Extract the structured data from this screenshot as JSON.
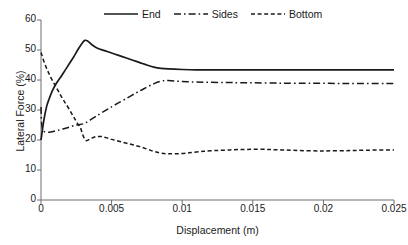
{
  "chart_data": {
    "type": "line",
    "title": "",
    "xlabel": "Displacement (m)",
    "ylabel": "Lateral Force (%)",
    "xlim": [
      0,
      0.025
    ],
    "ylim": [
      0,
      60
    ],
    "xticks": [
      "0",
      "0.005",
      "0.01",
      "0.015",
      "0.02",
      "0.025"
    ],
    "xtick_values": [
      0,
      0.005,
      0.01,
      0.015,
      0.02,
      0.025
    ],
    "yticks": [
      "0",
      "10",
      "20",
      "30",
      "40",
      "50",
      "60"
    ],
    "ytick_values": [
      0,
      10,
      20,
      30,
      40,
      50,
      60
    ],
    "grid": false,
    "legend_position": "top-center",
    "line_color": "#1a1a1a",
    "series": [
      {
        "name": "End",
        "style": "solid",
        "x": [
          0.0,
          0.0002,
          0.0004,
          0.0006,
          0.0008,
          0.0011,
          0.0014,
          0.0017,
          0.002,
          0.0023,
          0.0026,
          0.0029,
          0.0031,
          0.0033,
          0.0036,
          0.004,
          0.0045,
          0.005,
          0.0055,
          0.006,
          0.0065,
          0.007,
          0.0075,
          0.008,
          0.0085,
          0.009,
          0.01,
          0.011,
          0.0125,
          0.014,
          0.016,
          0.018,
          0.02,
          0.0225,
          0.025
        ],
        "values": [
          20.0,
          26.5,
          31.2,
          34.0,
          36.4,
          39.0,
          41.0,
          43.2,
          45.4,
          47.6,
          50.0,
          52.2,
          53.2,
          53.0,
          51.8,
          50.6,
          49.8,
          49.0,
          48.2,
          47.4,
          46.6,
          45.8,
          45.0,
          44.3,
          43.9,
          43.7,
          43.5,
          43.4,
          43.4,
          43.4,
          43.4,
          43.4,
          43.4,
          43.4,
          43.4
        ]
      },
      {
        "name": "Sides",
        "style": "dashdot",
        "x": [
          0.0,
          0.0001,
          0.0005,
          0.001,
          0.0014,
          0.0018,
          0.0022,
          0.0026,
          0.003,
          0.0034,
          0.0038,
          0.0042,
          0.0047,
          0.0052,
          0.0058,
          0.0064,
          0.007,
          0.0075,
          0.008,
          0.0085,
          0.009,
          0.01,
          0.011,
          0.0125,
          0.014,
          0.016,
          0.018,
          0.02,
          0.0225,
          0.025
        ],
        "values": [
          31.0,
          23.8,
          22.6,
          23.0,
          23.5,
          24.0,
          24.6,
          25.1,
          25.4,
          26.4,
          27.6,
          28.8,
          30.2,
          31.6,
          33.2,
          34.8,
          36.4,
          37.6,
          38.8,
          39.6,
          39.8,
          39.5,
          39.3,
          39.2,
          39.1,
          39.0,
          38.9,
          38.9,
          38.8,
          38.8
        ]
      },
      {
        "name": "Bottom",
        "style": "dashed",
        "x": [
          0.0,
          0.0003,
          0.0007,
          0.0011,
          0.0015,
          0.0019,
          0.0023,
          0.0026,
          0.0028,
          0.003,
          0.0032,
          0.0035,
          0.0038,
          0.0042,
          0.0046,
          0.005,
          0.0055,
          0.006,
          0.0065,
          0.007,
          0.0075,
          0.008,
          0.0085,
          0.009,
          0.01,
          0.011,
          0.012,
          0.013,
          0.014,
          0.0155,
          0.017,
          0.019,
          0.021,
          0.023,
          0.025
        ],
        "values": [
          49.2,
          45.0,
          40.8,
          37.4,
          34.0,
          31.0,
          27.8,
          25.4,
          24.0,
          21.2,
          19.8,
          20.4,
          21.0,
          21.2,
          20.8,
          20.2,
          19.6,
          19.0,
          18.4,
          17.8,
          17.0,
          16.2,
          15.6,
          15.4,
          15.5,
          16.0,
          16.4,
          16.6,
          16.8,
          16.9,
          16.7,
          16.4,
          16.4,
          16.6,
          16.7
        ]
      }
    ]
  },
  "legend": {
    "items": [
      {
        "label": "End",
        "style": "solid"
      },
      {
        "label": "Sides",
        "style": "dashdot"
      },
      {
        "label": "Bottom",
        "style": "dashed"
      }
    ]
  }
}
